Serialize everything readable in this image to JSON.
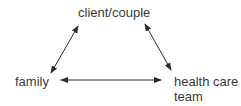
{
  "nodes": {
    "top": "client/couple",
    "left": "family",
    "right_line1": "health care",
    "right_line2": "team"
  },
  "edges": [
    {
      "from": "client/couple",
      "to": "family",
      "type": "bidirectional"
    },
    {
      "from": "client/couple",
      "to": "health care team",
      "type": "bidirectional"
    },
    {
      "from": "family",
      "to": "health care team",
      "type": "bidirectional"
    }
  ],
  "colors": {
    "text": "#3a3a3a",
    "arrow": "#2a2a2a"
  }
}
